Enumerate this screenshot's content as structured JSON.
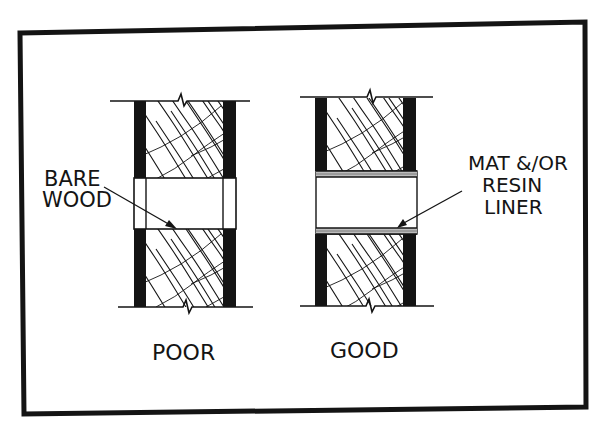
{
  "figure": {
    "labels": {
      "bare_line1": "BARE",
      "bare_line2": "WOOD",
      "liner_line1": "MAT &/OR",
      "liner_line2": "RESIN",
      "liner_line3": "LINER",
      "poor": "POOR",
      "good": "GOOD"
    },
    "colors": {
      "ink": "#141414",
      "paper": "#ffffff",
      "liner": "#9a9a9a"
    }
  }
}
